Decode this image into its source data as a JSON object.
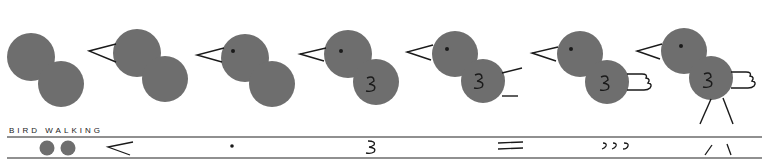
{
  "illustration": {
    "title": "BIRD WALKING",
    "colors": {
      "thumbprint": "#6e6e6e",
      "ink": "#1a1a1a",
      "background": "#ffffff"
    },
    "steps": [
      {
        "index": 1,
        "parts": [
          "head",
          "body"
        ]
      },
      {
        "index": 2,
        "parts": [
          "head",
          "body",
          "beak"
        ]
      },
      {
        "index": 3,
        "parts": [
          "head",
          "body",
          "beak",
          "eye"
        ]
      },
      {
        "index": 4,
        "parts": [
          "head",
          "body",
          "beak",
          "eye",
          "wing"
        ]
      },
      {
        "index": 5,
        "parts": [
          "head",
          "body",
          "beak",
          "eye",
          "wing",
          "tail-lines"
        ]
      },
      {
        "index": 6,
        "parts": [
          "head",
          "body",
          "beak",
          "eye",
          "wing",
          "tail-feathers"
        ]
      },
      {
        "index": 7,
        "parts": [
          "head",
          "body",
          "beak",
          "eye",
          "wing",
          "tail-feathers",
          "legs"
        ]
      }
    ],
    "strip": {
      "symbols": [
        "two-thumbprints",
        "<",
        "•",
        "3",
        "=",
        "ɔɔɔ",
        "/ \\"
      ]
    }
  }
}
